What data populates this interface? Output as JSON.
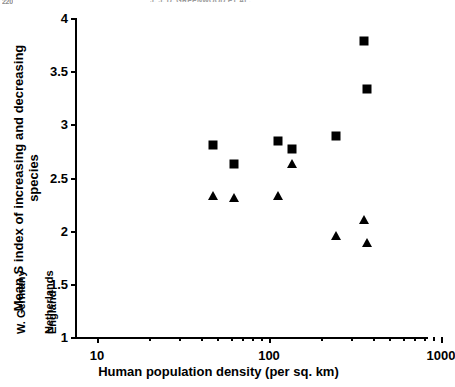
{
  "page": {
    "top_cropped_text_left": "220",
    "top_cropped_text_right": "J. J. D. GREENWOOD ET AL."
  },
  "chart_data": {
    "type": "scatter",
    "title": "",
    "xlabel": "Human population density (per sq. km)",
    "ylabel": "Mean S index of increasing and decreasing species",
    "ylabel_line1": "Mean S index of increasing and decreasing",
    "ylabel_line2": "species",
    "xscale": "log",
    "xlim": [
      10,
      1000
    ],
    "ylim": [
      1,
      4
    ],
    "xticks": [
      10,
      100,
      1000
    ],
    "xtick_labels": [
      "10",
      "100",
      "1000"
    ],
    "yticks": [
      1,
      1.5,
      2,
      2.5,
      3,
      3.5,
      4
    ],
    "ytick_labels": [
      "1",
      "1.5",
      "2",
      "2.5",
      "3",
      "3.5",
      "4"
    ],
    "grid": false,
    "legend": "none",
    "categories": [
      "R. of Ireland",
      "Scotland",
      "N. Ireland",
      "Wales",
      "W. Germany",
      "Netherlands",
      "England"
    ],
    "x": [
      47,
      63,
      113,
      136,
      246,
      355,
      372
    ],
    "series": [
      {
        "name": "increasing species",
        "marker": "square",
        "color": "#000000",
        "values": [
          2.81,
          2.63,
          2.84,
          2.77,
          2.89,
          3.78,
          3.33
        ]
      },
      {
        "name": "decreasing species",
        "marker": "triangle",
        "color": "#000000",
        "values": [
          2.33,
          2.31,
          2.33,
          2.63,
          1.95,
          2.1,
          1.88
        ]
      }
    ],
    "category_label_x": [
      47,
      63,
      113,
      136,
      246,
      355,
      372
    ],
    "minor_xticks": [
      20,
      30,
      40,
      50,
      60,
      70,
      80,
      90,
      200,
      300,
      400,
      500,
      600,
      700,
      800,
      900
    ]
  }
}
